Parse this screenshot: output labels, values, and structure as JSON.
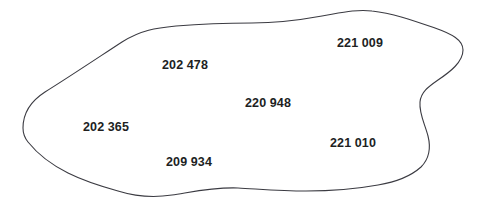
{
  "figure": {
    "type": "map-region-diagram",
    "background_color": "#ffffff",
    "outline_color": "#3b3b42",
    "label_color": "#211f1f",
    "width": 480,
    "height": 211
  },
  "region": {
    "name": "irregular-closed-boundary",
    "fill_color": "#ffffff",
    "stroke_color": "#3b3b42",
    "stroke_width": 1.1
  },
  "labels": [
    {
      "id": "parcel-202478",
      "text": "202 478",
      "x": 185,
      "y": 65
    },
    {
      "id": "parcel-221009",
      "text": "221 009",
      "x": 360,
      "y": 43
    },
    {
      "id": "parcel-220948",
      "text": "220 948",
      "x": 268,
      "y": 103
    },
    {
      "id": "parcel-202365",
      "text": "202 365",
      "x": 106,
      "y": 127
    },
    {
      "id": "parcel-221010",
      "text": "221 010",
      "x": 353,
      "y": 143
    },
    {
      "id": "parcel-209934",
      "text": "209 934",
      "x": 189,
      "y": 162
    }
  ]
}
